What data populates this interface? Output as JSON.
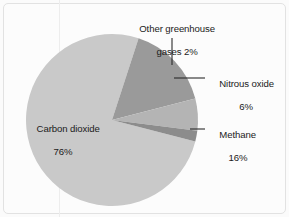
{
  "chart_data": {
    "type": "pie",
    "title": "",
    "subtitle": "",
    "xlabel": "",
    "ylabel": "",
    "legend_position": "none",
    "grid": false,
    "unit": "%",
    "categories": [
      "Carbon dioxide",
      "Methane",
      "Nitrous oxide",
      "Other greenhouse gases"
    ],
    "values": [
      76,
      16,
      6,
      2
    ],
    "slices": [
      {
        "name": "Carbon dioxide",
        "value": 76,
        "value_label": "76%",
        "label_line1": "Carbon dioxide",
        "label_line2": "76%",
        "color": "#c9c9c9",
        "start_angle_deg": 14.4,
        "end_angle_deg": 288.0,
        "label_placement": "inside"
      },
      {
        "name": "Methane",
        "value": 16,
        "value_label": "16%",
        "label_line1": "Methane",
        "label_line2": "16%",
        "color": "#9a9a9a",
        "start_angle_deg": 288.0,
        "end_angle_deg": 345.6,
        "label_placement": "outside-right"
      },
      {
        "name": "Nitrous oxide",
        "value": 6,
        "value_label": "6%",
        "label_line1": "Nitrous oxide",
        "label_line2": "6%",
        "color": "#b4b4b4",
        "start_angle_deg": 345.6,
        "end_angle_deg": 367.2,
        "label_placement": "outside-right"
      },
      {
        "name": "Other greenhouse gases",
        "value": 2,
        "value_label": "2%",
        "label_line1": "Other greenhouse",
        "label_line2": "gases 2%",
        "color": "#8c8c8c",
        "start_angle_deg": 367.2,
        "end_angle_deg": 374.4,
        "label_placement": "outside-top"
      }
    ]
  },
  "labels": {
    "other": {
      "line1": "Other greenhouse",
      "line2": "gases 2%"
    },
    "nitrous": {
      "line1": "Nitrous oxide",
      "line2": "6%"
    },
    "methane": {
      "line1": "Methane",
      "line2": "16%"
    },
    "carbon_dioxide": {
      "line1": "Carbon dioxide",
      "line2": "76%"
    }
  },
  "colors": {
    "background": "#fcfcfc",
    "frame_border": "#e2e2e2",
    "guide_line": "#ededed",
    "leader_line": "#2a2a2a",
    "text": "#1b1b1b",
    "carbon_dioxide": "#c9c9c9",
    "methane": "#9a9a9a",
    "nitrous_oxide": "#b4b4b4",
    "other_gases": "#8c8c8c"
  }
}
